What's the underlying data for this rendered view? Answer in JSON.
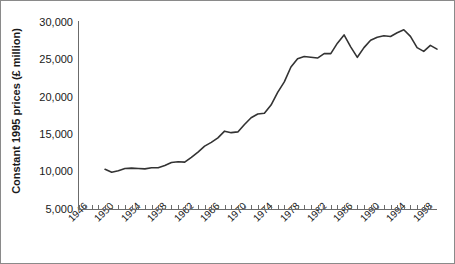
{
  "chart_data": {
    "type": "line",
    "title": "",
    "xlabel": "",
    "ylabel": "Constant 1995 prices (£ million)",
    "ylim": [
      5000,
      30000
    ],
    "xlim": [
      1946,
      2000
    ],
    "grid": false,
    "legend": null,
    "ytick_labels": [
      "30,000",
      "25,000",
      "20,000",
      "15,000",
      "10,000",
      "5,000"
    ],
    "ytick_values": [
      30000,
      25000,
      20000,
      15000,
      10000,
      5000
    ],
    "xtick_labels": [
      "1946",
      "1950",
      "1954",
      "1958",
      "1962",
      "1966",
      "1970",
      "1974",
      "1978",
      "1982",
      "1986",
      "1990",
      "1994",
      "1998"
    ],
    "xtick_values": [
      1946,
      1950,
      1954,
      1958,
      1962,
      1966,
      1970,
      1974,
      1978,
      1982,
      1986,
      1990,
      1994,
      1998
    ],
    "minor_tick_interval": 1,
    "series": [
      {
        "name": "Constant 1995 prices",
        "color": "#333333",
        "x": [
          1950,
          1951,
          1952,
          1953,
          1954,
          1955,
          1956,
          1957,
          1958,
          1959,
          1960,
          1961,
          1962,
          1963,
          1964,
          1965,
          1966,
          1967,
          1968,
          1969,
          1970,
          1971,
          1972,
          1973,
          1974,
          1975,
          1976,
          1977,
          1978,
          1979,
          1980,
          1981,
          1982,
          1983,
          1984,
          1985,
          1986,
          1987,
          1988,
          1989,
          1990,
          1991,
          1992,
          1993,
          1994,
          1995,
          1996,
          1997,
          1998,
          1999,
          2000
        ],
        "values": [
          10400,
          10000,
          10200,
          10500,
          10550,
          10500,
          10450,
          10600,
          10600,
          10900,
          11300,
          11400,
          11350,
          12000,
          12700,
          13500,
          14000,
          14600,
          15500,
          15300,
          15400,
          16400,
          17300,
          17800,
          17900,
          19000,
          20700,
          22100,
          24100,
          25200,
          25500,
          25400,
          25300,
          25900,
          25900,
          27300,
          28400,
          26800,
          25400,
          26700,
          27700,
          28100,
          28300,
          28200,
          28700,
          29100,
          28200,
          26700,
          26200,
          27000,
          26500
        ]
      }
    ]
  },
  "axes": {
    "y_axis_line": "vertical-axis",
    "x_axis_line": "horizontal-axis"
  }
}
